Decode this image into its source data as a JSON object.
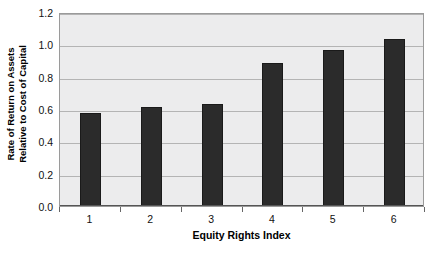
{
  "chart_data": {
    "type": "bar",
    "title": "",
    "subtitle": "",
    "categories": [
      "1",
      "2",
      "3",
      "4",
      "5",
      "6"
    ],
    "values": [
      0.575,
      0.615,
      0.63,
      0.885,
      0.965,
      1.03
    ],
    "xlabel": "Equity Rights Index",
    "ylabel": "Rate of Return on Assets Relative to Cost of Capital",
    "ylabel_lines": [
      "Rate of Return on Assets",
      "Relative to Cost of Capital"
    ],
    "ylim": [
      0.0,
      1.2
    ],
    "yticks": [
      "0.0",
      "0.2",
      "0.4",
      "0.6",
      "0.8",
      "1.0",
      "1.2"
    ],
    "ytick_values": [
      0.0,
      0.2,
      0.4,
      0.6,
      0.8,
      1.0,
      1.2
    ],
    "grid": "horizontal",
    "legend": "none",
    "colors": {
      "bar": "#2b2b2b",
      "plot_background": "#ececed",
      "gridline": "#b4b4b4",
      "axis": "#555555",
      "text": "#111111"
    }
  }
}
